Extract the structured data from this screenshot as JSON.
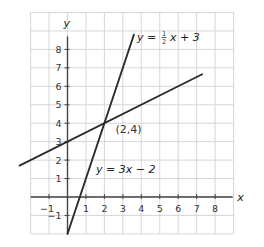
{
  "chart_data": {
    "type": "line",
    "title": "",
    "xlabel": "x",
    "ylabel": "y",
    "xlim": [
      -2,
      9
    ],
    "ylim": [
      -2,
      10
    ],
    "grid": true,
    "x_ticks": [
      -1,
      1,
      2,
      3,
      4,
      5,
      6,
      7,
      8
    ],
    "y_ticks": [
      -1,
      1,
      2,
      3,
      4,
      5,
      6,
      7,
      8
    ],
    "series": [
      {
        "name": "y = 1/2 x + 3",
        "label_parts": {
          "lhs": "y = ",
          "num": "1",
          "den": "2",
          "rhs": "x + 3"
        },
        "slope": 0.5,
        "intercept": 3,
        "x_range": [
          -2.6,
          7.3
        ],
        "points": [
          [
            -2.6,
            1.7
          ],
          [
            0,
            3
          ],
          [
            2,
            4
          ],
          [
            7.3,
            6.65
          ]
        ]
      },
      {
        "name": "y = 3x - 2",
        "label": "y = 3x − 2",
        "slope": 3,
        "intercept": -2,
        "x_range": [
          0,
          3.6
        ],
        "points": [
          [
            0,
            -2
          ],
          [
            1,
            1
          ],
          [
            2,
            4
          ],
          [
            3.6,
            8.8
          ]
        ]
      }
    ],
    "annotations": [
      {
        "text": "(2,4)",
        "x": 2,
        "y": 4,
        "note": "intersection point"
      }
    ]
  }
}
